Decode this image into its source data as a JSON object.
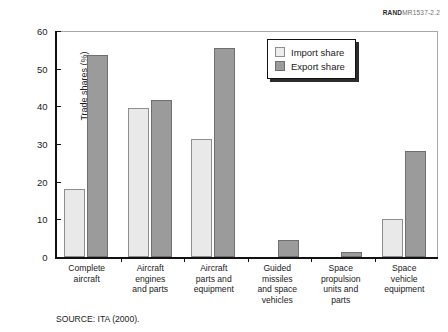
{
  "figure_id": {
    "bold_part": "RAND",
    "light_part": "MR1537-2.2"
  },
  "source_note": "SOURCE:  ITA (2000).",
  "legend": {
    "position": "top-right-inside",
    "entries": [
      {
        "label": "Import share",
        "swatch": "light-gray-square",
        "color": "#e9e9e9"
      },
      {
        "label": "Export share",
        "swatch": "gray-square",
        "color": "#9b9b9b"
      }
    ]
  },
  "chart_data": {
    "type": "bar",
    "title": "",
    "subtitle": "",
    "xlabel": "",
    "ylabel": "Trade shares (%)",
    "ylim": [
      0,
      60
    ],
    "yticks": [
      0,
      10,
      20,
      30,
      40,
      50,
      60
    ],
    "ytick_labels": [
      "0",
      "10",
      "20",
      "30",
      "40",
      "50",
      "60"
    ],
    "grid": false,
    "legend_position": "top right inside plot",
    "categories": [
      "Complete\naircraft",
      "Aircraft\nengines\nand parts",
      "Aircraft\nparts and\nequipment",
      "Guided\nmissiles\nand space\nvehicles",
      "Space\npropulsion\nunits and\nparts",
      "Space\nvehicle\nequipment"
    ],
    "series": [
      {
        "name": "Import share",
        "color": "#e9e9e9",
        "values": [
          18,
          39.5,
          31.3,
          0,
          0,
          10
        ]
      },
      {
        "name": "Export share",
        "color": "#9b9b9b",
        "values": [
          53.7,
          41.8,
          55.5,
          4.6,
          1.4,
          28.2
        ]
      }
    ]
  }
}
